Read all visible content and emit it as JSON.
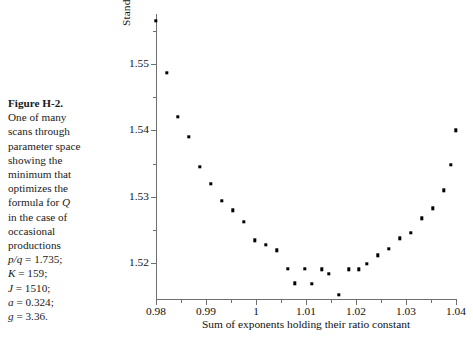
{
  "caption": {
    "figure_number": "Figure H-2.",
    "lines": [
      "One of many",
      "scans through",
      "parameter space",
      "showing the",
      "minimum that",
      "optimizes the"
    ],
    "line_formula_prefix": "formula for ",
    "line_formula_symbol": "Q",
    "lines_after": [
      "in the case of",
      "occasional",
      "productions"
    ],
    "parameters": [
      {
        "symbol": "p/q",
        "value": "= 1.735;"
      },
      {
        "symbol": "K",
        "value": "= 159;"
      },
      {
        "symbol": "J",
        "value": "= 1510;"
      },
      {
        "symbol": "a",
        "value": "= 0.324;"
      },
      {
        "symbol": "g",
        "value": "= 3.36."
      }
    ]
  },
  "chart_data": {
    "type": "scatter",
    "title": "",
    "xlabel": "Sum of exponents holding their ratio constant",
    "ylabel_prefix": "Standard deviation from linear ",
    "ylabel_symbol": "Q",
    "xlim": [
      0.98,
      1.04
    ],
    "ylim": [
      1.5145,
      1.5575
    ],
    "grid": false,
    "legend": null,
    "xticks": [
      0.98,
      0.99,
      1.0,
      1.01,
      1.02,
      1.03,
      1.04
    ],
    "xticklabels": [
      "0.98",
      "0.99",
      "1",
      "1.01",
      "1.02",
      "1.03",
      "1.04"
    ],
    "xticks_minor": [
      0.985,
      0.995,
      1.005,
      1.015,
      1.025,
      1.035
    ],
    "yticks": [
      1.52,
      1.53,
      1.54,
      1.55
    ],
    "yticklabels": [
      "1.52",
      "1.53",
      "1.54",
      "1.55"
    ],
    "yticks_minor": [
      1.525,
      1.535,
      1.545,
      1.555
    ],
    "marker": "square",
    "marker_color": "#000000",
    "points": [
      {
        "x": 0.98,
        "y": 1.5565
      },
      {
        "x": 0.9822,
        "y": 1.5487
      },
      {
        "x": 0.9844,
        "y": 1.542
      },
      {
        "x": 0.9866,
        "y": 1.539
      },
      {
        "x": 0.9888,
        "y": 1.5345
      },
      {
        "x": 0.991,
        "y": 1.532
      },
      {
        "x": 0.9932,
        "y": 1.5294
      },
      {
        "x": 0.9954,
        "y": 1.528
      },
      {
        "x": 0.9976,
        "y": 1.5263
      },
      {
        "x": 0.9998,
        "y": 1.5235
      },
      {
        "x": 1.002,
        "y": 1.5228
      },
      {
        "x": 1.0042,
        "y": 1.522
      },
      {
        "x": 1.0064,
        "y": 1.5192
      },
      {
        "x": 1.0078,
        "y": 1.517
      },
      {
        "x": 1.0098,
        "y": 1.5192
      },
      {
        "x": 1.0112,
        "y": 1.5169
      },
      {
        "x": 1.0132,
        "y": 1.5191
      },
      {
        "x": 1.0145,
        "y": 1.5184
      },
      {
        "x": 1.0165,
        "y": 1.5153
      },
      {
        "x": 1.0185,
        "y": 1.5191
      },
      {
        "x": 1.0205,
        "y": 1.5191
      },
      {
        "x": 1.0222,
        "y": 1.5199
      },
      {
        "x": 1.0244,
        "y": 1.5212
      },
      {
        "x": 1.0266,
        "y": 1.5222
      },
      {
        "x": 1.0288,
        "y": 1.5238
      },
      {
        "x": 1.031,
        "y": 1.5246
      },
      {
        "x": 1.0332,
        "y": 1.5268
      },
      {
        "x": 1.0354,
        "y": 1.5283
      },
      {
        "x": 1.0376,
        "y": 1.531
      },
      {
        "x": 1.039,
        "y": 1.5348
      },
      {
        "x": 1.04,
        "y": 1.54
      }
    ]
  }
}
